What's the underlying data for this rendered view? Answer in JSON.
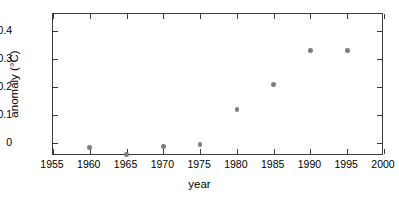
{
  "chart_data": {
    "type": "scatter",
    "title": "",
    "xlabel": "year",
    "ylabel": "anomaly (°C)",
    "x": [
      1960,
      1965,
      1970,
      1975,
      1980,
      1985,
      1990,
      1995
    ],
    "values": [
      -0.015,
      -0.04,
      -0.012,
      -0.005,
      0.12,
      0.21,
      0.33,
      0.33
    ],
    "series": [
      {
        "name": "anomaly",
        "points": [
          {
            "x": 1960,
            "y": -0.015
          },
          {
            "x": 1965,
            "y": -0.04
          },
          {
            "x": 1970,
            "y": -0.012
          },
          {
            "x": 1975,
            "y": -0.005
          },
          {
            "x": 1980,
            "y": 0.12
          },
          {
            "x": 1985,
            "y": 0.21
          },
          {
            "x": 1990,
            "y": 0.33
          },
          {
            "x": 1995,
            "y": 0.33
          }
        ]
      }
    ],
    "xlim": [
      1955,
      2000
    ],
    "ylim": [
      -0.045,
      0.46
    ],
    "xticks": [
      1955,
      1960,
      1965,
      1970,
      1975,
      1980,
      1985,
      1990,
      1995,
      2000
    ],
    "xtick_labels": [
      "1955",
      "1960",
      "1965",
      "1970",
      "1975",
      "1980",
      "1985",
      "1990",
      "1995",
      "2000"
    ],
    "yticks": [
      0,
      0.1,
      0.2,
      0.3,
      0.4
    ],
    "ytick_labels": [
      "0",
      "0.1",
      "0.2",
      "0.3",
      "0.4"
    ],
    "grid": false,
    "legend": false,
    "marker_color": "#7d7d7d",
    "axis_color": "#3a3a3a",
    "background": "#ffffff"
  }
}
